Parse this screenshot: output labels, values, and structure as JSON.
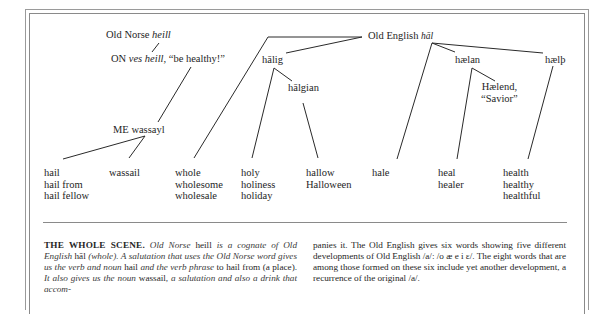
{
  "diagram": {
    "title_node_norse": {
      "prefix": "Old Norse",
      "word": "heill"
    },
    "node_on_phrase": {
      "prefix": "ON",
      "phrase_italic": "ves heill,",
      "gloss": "“be healthy!”"
    },
    "node_me": "ME wassayl",
    "node_oe": {
      "prefix": "Old English",
      "word": "hāl"
    },
    "node_halig": "hālig",
    "node_halgian": "hālgian",
    "node_haelan": "hælan",
    "node_haelth": "hælþ",
    "node_haelend": {
      "line1": "Hælend,",
      "line2": "“Savior”"
    },
    "columns": [
      {
        "id": "hail",
        "words": [
          "hail",
          "hail from",
          "hail fellow"
        ]
      },
      {
        "id": "wassail",
        "words": [
          "wassail"
        ]
      },
      {
        "id": "whole",
        "words": [
          "whole",
          "wholesome",
          "wholesale"
        ]
      },
      {
        "id": "holy",
        "words": [
          "holy",
          "holiness",
          "holiday"
        ]
      },
      {
        "id": "hallow",
        "words": [
          "hallow",
          "Halloween"
        ]
      },
      {
        "id": "hale",
        "words": [
          "hale"
        ]
      },
      {
        "id": "heal",
        "words": [
          "heal",
          "healer"
        ]
      },
      {
        "id": "health",
        "words": [
          "health",
          "healthy",
          "healthful"
        ]
      }
    ],
    "line_color": "#2a2a2a"
  },
  "caption": {
    "heading": "THE WHOLE SCENE.",
    "left_segments": [
      {
        "t": " ",
        "s": "n"
      },
      {
        "t": "Old Norse",
        "s": "i"
      },
      {
        "t": " heill ",
        "s": "n"
      },
      {
        "t": "is a cognate of Old English",
        "s": "i"
      },
      {
        "t": " hāl ",
        "s": "n"
      },
      {
        "t": "(whole). A salutation that uses the Old Norse word gives us the verb and noun",
        "s": "i"
      },
      {
        "t": " hail ",
        "s": "n"
      },
      {
        "t": "and the verb phrase",
        "s": "i"
      },
      {
        "t": " to hail from (a place). ",
        "s": "n"
      },
      {
        "t": "It also gives us the noun",
        "s": "i"
      },
      {
        "t": " wassail",
        "s": "n"
      },
      {
        "t": ", a salutation and also a drink that accom-",
        "s": "i"
      }
    ],
    "right_text": "panies it. The Old English gives six words showing five different developments of Old English /a/: /o æ e i ɛ/. The eight words that are among those formed on these six include yet another development, a recurrence of the original /a/."
  }
}
